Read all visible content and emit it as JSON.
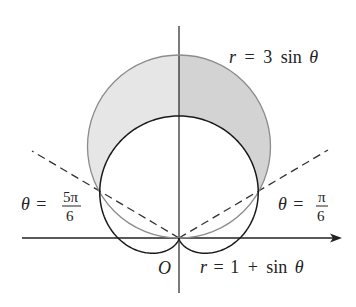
{
  "diagram": {
    "type": "polar-curves",
    "origin_label": "O",
    "curves": [
      {
        "name": "circle",
        "equation_lhs": "r",
        "equation_rhs_num": "3",
        "equation_rhs_fn": "sin",
        "equation_var": "θ",
        "stroke": "#8c8c8c"
      },
      {
        "name": "cardioid",
        "equation_lhs": "r",
        "equation_rhs_num": "1",
        "equation_op": "+",
        "equation_rhs_fn": "sin",
        "equation_var": "θ",
        "stroke": "#1a1a1a"
      }
    ],
    "rays": [
      {
        "label_var": "θ",
        "label_num": "5π",
        "label_den": "6",
        "angle": "5π/6"
      },
      {
        "label_var": "θ",
        "label_num": "π",
        "label_den": "6",
        "angle": "π/6"
      }
    ],
    "shading": {
      "region": "inside r = 3 sin θ and outside r = 1 + sin θ",
      "left_fill": "#e6e6e6",
      "right_fill": "#d3d3d3"
    },
    "equals": "="
  }
}
